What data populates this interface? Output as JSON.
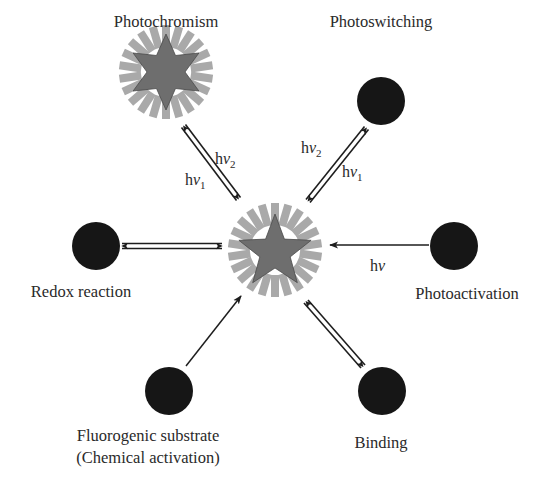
{
  "diagram": {
    "colors": {
      "ray": "#a9a9a9",
      "star": "#6e6e6e",
      "circle": "#161616",
      "arrow": "#1e1e1e",
      "text": "#2a2a2a"
    },
    "center": {
      "name": "fluorophore-on",
      "shape": "five-pointed-star-with-rays"
    },
    "nodes": [
      {
        "id": "photochromism",
        "label": "Photochromism",
        "shape": "six-pointed-star-with-rays",
        "arrow": "double-headed-double-line"
      },
      {
        "id": "photoswitching",
        "label": "Photoswitching",
        "shape": "black-circle",
        "arrow": "double-headed-double-line"
      },
      {
        "id": "photoactivation",
        "label": "Photoactivation",
        "shape": "black-circle",
        "arrow": "single-line-to-center"
      },
      {
        "id": "binding",
        "label": "Binding",
        "shape": "black-circle",
        "arrow": "double-headed-double-line"
      },
      {
        "id": "fluorogenic",
        "label_line1": "Fluorogenic substrate",
        "label_line2": "(Chemical activation)",
        "shape": "black-circle",
        "arrow": "single-line-to-center"
      },
      {
        "id": "redox",
        "label": "Redox reaction",
        "shape": "black-circle",
        "arrow": "double-headed-double-line"
      }
    ],
    "arrow_labels": {
      "photochromism_upper": {
        "h": "h",
        "nu": "ν",
        "sub": "2"
      },
      "photochromism_lower": {
        "h": "h",
        "nu": "ν",
        "sub": "1"
      },
      "photoswitching_upper": {
        "h": "h",
        "nu": "ν",
        "sub": "2"
      },
      "photoswitching_lower": {
        "h": "h",
        "nu": "ν",
        "sub": "1"
      },
      "photoactivation": {
        "h": "h",
        "nu": "ν"
      }
    }
  }
}
